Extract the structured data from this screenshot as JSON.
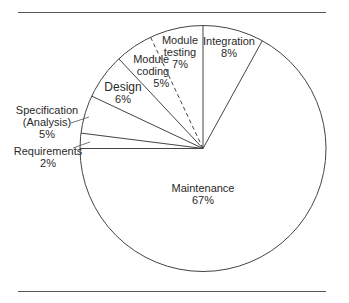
{
  "chart_data": {
    "type": "pie",
    "title": "",
    "start_angle_deg": 270,
    "direction": "clockwise",
    "slices": [
      {
        "label": "Requirements",
        "value": 2,
        "display": "2%",
        "boundary_style": "solid"
      },
      {
        "label": "Specification (Analysis)",
        "value": 5,
        "display": "5%",
        "boundary_style": "solid"
      },
      {
        "label": "Design",
        "value": 6,
        "display": "6%",
        "boundary_style": "solid"
      },
      {
        "label": "Module coding",
        "value": 5,
        "display": "5%",
        "boundary_style": "solid"
      },
      {
        "label": "Module testing",
        "value": 7,
        "display": "7%",
        "boundary_style": "dashed"
      },
      {
        "label": "Integration",
        "value": 8,
        "display": "8%",
        "boundary_style": "solid"
      },
      {
        "label": "Maintenance",
        "value": 67,
        "display": "67%",
        "boundary_style": "solid"
      }
    ],
    "categories": [
      "Requirements",
      "Specification (Analysis)",
      "Design",
      "Module coding",
      "Module testing",
      "Integration",
      "Maintenance"
    ],
    "values": [
      2,
      5,
      6,
      5,
      7,
      8,
      67
    ],
    "legend": "none (labels placed on/next to slices)",
    "colors": {
      "fill": "#ffffff",
      "stroke": "#444444",
      "text": "#2a2a2a",
      "rule": "#555555"
    }
  },
  "labels": {
    "requirements": {
      "line1": "Requirements",
      "line2": "2%"
    },
    "specification": {
      "line1": "Specification",
      "line2": "(Analysis)",
      "line3": "5%"
    },
    "design": {
      "line1": "Design",
      "line2": "6%"
    },
    "coding": {
      "line1": "Module",
      "line2": "coding",
      "line3": "5%"
    },
    "testing": {
      "line1": "Module",
      "line2": "testing",
      "line3": "7%"
    },
    "integration": {
      "line1": "Integration",
      "line2": "8%"
    },
    "maintenance": {
      "line1": "Maintenance",
      "line2": "67%"
    }
  }
}
